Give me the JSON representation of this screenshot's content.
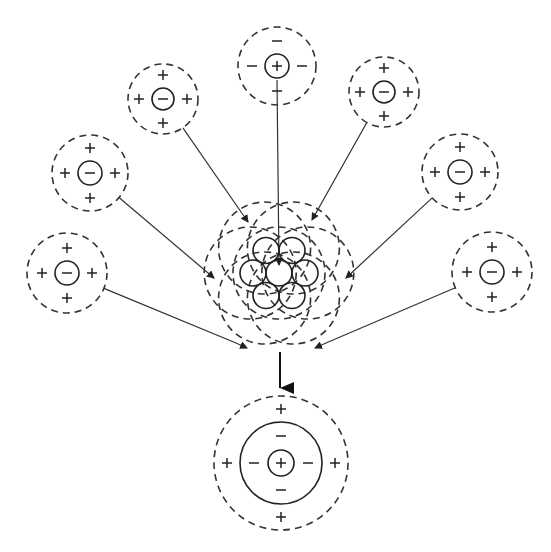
{
  "diagram": {
    "colors": {
      "ink": "#222222",
      "background": "#ffffff"
    },
    "symbols": {
      "plus": "+",
      "minus": "−"
    },
    "surrounding_ions": [
      {
        "id": "top",
        "cx": 277,
        "cy": 66,
        "r_outer": 39,
        "r_inner": 12,
        "core": "+",
        "shell": [
          "−",
          "−",
          "−",
          "−"
        ]
      },
      {
        "id": "upper-left",
        "cx": 163,
        "cy": 99,
        "r_outer": 35,
        "r_inner": 11,
        "core": "−",
        "shell": [
          "+",
          "+",
          "+",
          "+"
        ]
      },
      {
        "id": "upper-right",
        "cx": 384,
        "cy": 92,
        "r_outer": 35,
        "r_inner": 11,
        "core": "−",
        "shell": [
          "+",
          "+",
          "+",
          "+"
        ]
      },
      {
        "id": "left-mid",
        "cx": 90,
        "cy": 173,
        "r_outer": 38,
        "r_inner": 12,
        "core": "−",
        "shell": [
          "+",
          "+",
          "+",
          "+"
        ]
      },
      {
        "id": "right-mid",
        "cx": 460,
        "cy": 172,
        "r_outer": 38,
        "r_inner": 12,
        "core": "−",
        "shell": [
          "+",
          "+",
          "+",
          "+"
        ]
      },
      {
        "id": "left-low",
        "cx": 67,
        "cy": 273,
        "r_outer": 40,
        "r_inner": 12,
        "core": "−",
        "shell": [
          "+",
          "+",
          "+",
          "+"
        ]
      },
      {
        "id": "right-low",
        "cx": 492,
        "cy": 272,
        "r_outer": 40,
        "r_inner": 12,
        "core": "−",
        "shell": [
          "+",
          "+",
          "+",
          "+"
        ]
      }
    ],
    "cluster": {
      "cx": 279,
      "cy": 273,
      "circle_r": 13,
      "spacing": 26,
      "dashed_r": 46,
      "dashed_offset": 18
    },
    "result": {
      "cx": 281,
      "cy": 463,
      "r_outer": 67,
      "r_middle": 41,
      "r_inner": 13,
      "core": "+",
      "middle_shell": [
        "−",
        "−",
        "−",
        "−"
      ],
      "outer_shell": [
        "+",
        "+",
        "+",
        "+"
      ]
    },
    "down_arrow": {
      "x": 280,
      "y1": 352,
      "y2": 388
    }
  }
}
